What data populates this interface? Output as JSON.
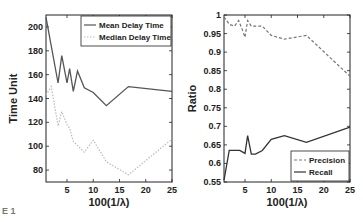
{
  "caption": "E 1",
  "chart_data": [
    {
      "type": "line",
      "xlabel": "100(1/λ)",
      "ylabel": "Time Unit",
      "xlim": [
        1,
        25
      ],
      "ylim": [
        70,
        210
      ],
      "xticks": [
        5,
        10,
        15,
        20,
        25
      ],
      "yticks": [
        80,
        100,
        120,
        140,
        160,
        180,
        200
      ],
      "legend_position": "upper right",
      "series": [
        {
          "name": "Mean Delay Time",
          "color": "#555555",
          "style": "solid",
          "x": [
            1,
            3.3,
            4,
            5,
            5.5,
            6.2,
            7,
            8.3,
            10,
            12.5,
            16.7,
            25
          ],
          "y": [
            208,
            153,
            176,
            153,
            165,
            146,
            163,
            149,
            145,
            134,
            150,
            146
          ]
        },
        {
          "name": "Median Delay Time",
          "color": "#bbbbbb",
          "style": "dotted",
          "x": [
            1,
            2,
            3.3,
            4,
            5,
            5.5,
            6.2,
            8.3,
            10,
            12.5,
            16.7,
            25
          ],
          "y": [
            143,
            150,
            117,
            129,
            118,
            115,
            104,
            95,
            105,
            87,
            76,
            106
          ]
        }
      ]
    },
    {
      "type": "line",
      "xlabel": "100(1/λ)",
      "ylabel": "Ratio",
      "xlim": [
        1,
        25
      ],
      "ylim": [
        0.55,
        1.0
      ],
      "xticks": [
        5,
        10,
        15,
        20,
        25
      ],
      "yticks": [
        0.55,
        0.6,
        0.65,
        0.7,
        0.75,
        0.8,
        0.85,
        0.9,
        0.95,
        1
      ],
      "ytick_labels": [
        "0.55",
        "0.6",
        "0.65",
        "0.7",
        "0.75",
        "0.8",
        "0.85",
        "0.9",
        "0.95",
        "1"
      ],
      "legend_position": "lower right",
      "series": [
        {
          "name": "Precision",
          "color": "#777777",
          "style": "dashed",
          "x": [
            1,
            2,
            3,
            3.8,
            4.5,
            5,
            5.5,
            6.2,
            8.3,
            10,
            12.5,
            16.7,
            25
          ],
          "y": [
            0.995,
            0.975,
            0.97,
            0.985,
            0.96,
            0.94,
            0.985,
            0.97,
            0.97,
            0.945,
            0.935,
            0.945,
            0.835
          ]
        },
        {
          "name": "Recall",
          "color": "#333333",
          "style": "solid",
          "x": [
            1,
            2,
            3.3,
            4,
            5,
            5.5,
            6.2,
            7,
            8.3,
            10,
            12.5,
            16.7,
            25
          ],
          "y": [
            0.555,
            0.635,
            0.635,
            0.635,
            0.627,
            0.675,
            0.625,
            0.625,
            0.635,
            0.665,
            0.675,
            0.657,
            0.698
          ]
        }
      ]
    }
  ]
}
